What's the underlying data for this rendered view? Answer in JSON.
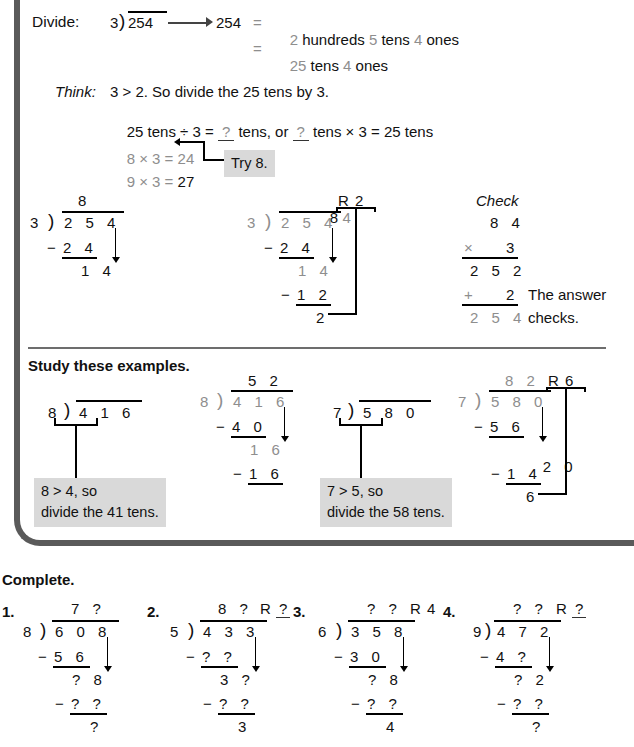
{
  "frame": {
    "border_color": "#5a5a5a"
  },
  "palette": {
    "gray_digit": "#8e8e8e",
    "callout_bg": "#d9d9d9",
    "rule": "#6d6d6d"
  },
  "intro": {
    "label": "Divide:",
    "problem_divisor": "3",
    "problem_dividend": "254",
    "arrow_target": "254",
    "eq1_sign": "=",
    "eq1": "2 hundreds 5 tens 4 ones",
    "eq1_parts": [
      "2",
      "hundreds",
      "5",
      "tens",
      "4",
      "ones"
    ],
    "eq2_sign": "=",
    "eq2": "25 tens 4 ones",
    "eq2_parts": [
      "25",
      "tens",
      "4",
      "ones"
    ]
  },
  "think": {
    "label": "Think:",
    "line1": "3 > 2. So divide the 25 tens by 3.",
    "line2_a": "25 tens ÷ 3 = ",
    "line2_q1": "?",
    "line2_b": " tens, or ",
    "line2_q2": "?",
    "line2_c": " tens × 3 = 25 tens",
    "fact1_left": "8 × 3 = ",
    "fact1_right": "24",
    "fact2_left": "9 × 3 = ",
    "fact2_right": "27",
    "callout": "Try 8."
  },
  "step1": {
    "quotient": "8",
    "divisor": "3",
    "dividend": "2 5 4",
    "sub_sign": "−",
    "sub": "2 4",
    "diff": "1 4"
  },
  "step2": {
    "quotient_a": "8",
    "quotient_b": "4",
    "remainder_label": "R",
    "remainder": "2",
    "divisor": "3",
    "dividend": "2 5 4",
    "sub1_sign": "−",
    "sub1": "2 4",
    "diff1": "1 4",
    "sub2_sign": "−",
    "sub2": "1 2",
    "diff2": "2"
  },
  "check": {
    "title": "Check",
    "row1": "8 4",
    "mult_sign": "×",
    "row2": "3",
    "product": "2 5 2",
    "plus_sign": "+",
    "add": "2",
    "total": "2 5 4",
    "note_line1": "The answer",
    "note_line2": "checks."
  },
  "examples": {
    "heading": "Study these examples.",
    "a": {
      "divisor": "8",
      "dividend": "4 1 6",
      "callout_line1": "8 > 4, so",
      "callout_line2": "divide the 41 tens."
    },
    "b": {
      "quotient": "5 2",
      "divisor": "8",
      "dividend": "4 1 6",
      "sub1_sign": "−",
      "sub1": "4 0",
      "diff1": "1 6",
      "sub2_sign": "−",
      "sub2": "1 6"
    },
    "c": {
      "divisor": "7",
      "dividend": "5 8 0",
      "callout_line1": "7 > 5, so",
      "callout_line2": "divide the 58 tens."
    },
    "d": {
      "quotient": "8 2",
      "remainder_label": "R",
      "remainder": "6",
      "divisor": "7",
      "dividend": "5 8 0",
      "sub1_sign": "−",
      "sub1": "5 6",
      "diff1": "2 0",
      "sub2_sign": "−",
      "sub2": "1 4",
      "diff2": "6"
    }
  },
  "complete": {
    "heading": "Complete.",
    "items": [
      {
        "number": "1.",
        "quotient": "7 ?",
        "remainder_label": "",
        "remainder": "",
        "divisor": "8",
        "dividend": "6 0 8",
        "sub1_sign": "−",
        "sub1": "5 6",
        "diff1": "? 8",
        "sub2_sign": "−",
        "sub2": "? ?",
        "diff2": "?"
      },
      {
        "number": "2.",
        "quotient": "8 ?",
        "remainder_label": "R",
        "remainder": "?",
        "divisor": "5",
        "dividend": "4 3 3",
        "sub1_sign": "−",
        "sub1": "? ?",
        "diff1": "3 ?",
        "sub2_sign": "−",
        "sub2": "? ?",
        "diff2": "3"
      },
      {
        "number": "3.",
        "quotient": "? ?",
        "remainder_label": "R",
        "remainder": "4",
        "divisor": "6",
        "dividend": "3 5 8",
        "sub1_sign": "−",
        "sub1": "3 0",
        "diff1": "? 8",
        "sub2_sign": "−",
        "sub2": "? ?",
        "diff2": "4"
      },
      {
        "number": "4.",
        "quotient": "? ?",
        "remainder_label": "R",
        "remainder": "?",
        "divisor": "9",
        "dividend": "4 7 2",
        "sub1_sign": "−",
        "sub1": "4 ?",
        "diff1": "? 2",
        "sub2_sign": "−",
        "sub2": "? ?",
        "diff2": "?"
      }
    ]
  }
}
